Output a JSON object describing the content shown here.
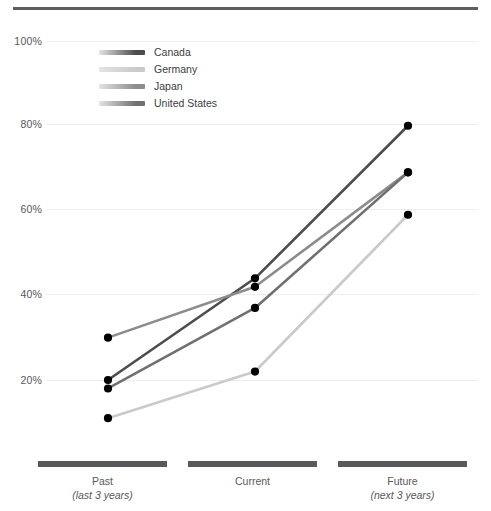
{
  "chart_data": {
    "type": "line",
    "title": "",
    "subtitle": "",
    "xlabel": "",
    "ylabel": "",
    "categories": [
      "Past",
      "Current",
      "Future"
    ],
    "category_sublabels": [
      "(last 3 years)",
      "",
      "(next 3 years)"
    ],
    "ylim": [
      0,
      105
    ],
    "yticks": [
      20,
      40,
      60,
      80,
      100
    ],
    "ytick_labels": [
      "20%",
      "40%",
      "60%",
      "80%",
      "100%"
    ],
    "grid": true,
    "legend_position": "inside-top-left",
    "series": [
      {
        "name": "Canada",
        "values": [
          20,
          44,
          80
        ],
        "color": "#4a4c4e"
      },
      {
        "name": "Germany",
        "values": [
          11,
          22,
          59
        ],
        "color": "#c9cacb"
      },
      {
        "name": "Japan",
        "values": [
          30,
          42,
          69
        ],
        "color": "#8a8c8e"
      },
      {
        "name": "United States",
        "values": [
          18,
          37,
          69
        ],
        "color": "#6e7072"
      }
    ],
    "point_marker": "filled-circle",
    "point_color": "#000000"
  },
  "axis": {
    "ytick_labels": [
      "100%",
      "80%",
      "60%",
      "40%",
      "20%"
    ]
  },
  "legend": {
    "items": [
      {
        "label": "Canada"
      },
      {
        "label": "Germany"
      },
      {
        "label": "Japan"
      },
      {
        "label": "United States"
      }
    ]
  },
  "xaxis": {
    "groups": [
      {
        "name": "Past",
        "sub": "(last 3 years)"
      },
      {
        "name": "Current",
        "sub": ""
      },
      {
        "name": "Future",
        "sub": "(next 3 years)"
      }
    ]
  }
}
